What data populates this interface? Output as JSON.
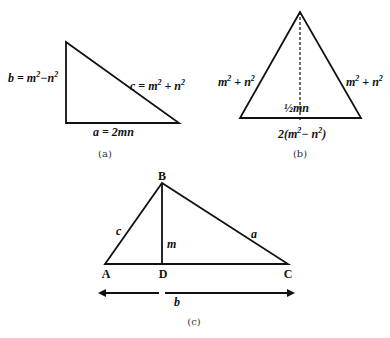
{
  "figure_a": {
    "caption": "(a)",
    "side_b_label": "b = m",
    "side_b_label_tail": "−n",
    "side_c_label": "c = m",
    "side_c_label_tail": " + n",
    "side_a_label": "a = 2mn",
    "exp": "2"
  },
  "figure_b": {
    "caption": "(b)",
    "left_side_label": "m",
    "left_side_tail": " + n",
    "right_side_label": "m",
    "right_side_tail": " + n",
    "height_label": "½mn",
    "base_label_head": "2(m",
    "base_label_mid": "− n",
    "base_label_close": ")",
    "exp": "2"
  },
  "figure_c": {
    "caption": "(c)",
    "vertex_A": "A",
    "vertex_B": "B",
    "vertex_C": "C",
    "vertex_D": "D",
    "side_c": "c",
    "side_a": "a",
    "altitude_m": "m",
    "base_b": "b"
  },
  "colors": {
    "stroke": "#111111",
    "background": "#ffffff"
  }
}
